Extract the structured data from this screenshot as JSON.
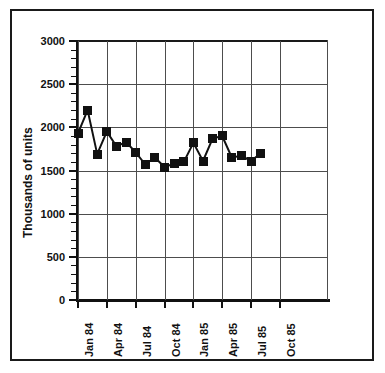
{
  "chart_data": {
    "type": "line",
    "title": "",
    "subtitle": "",
    "xlabel": "",
    "ylabel": "Thousands of units",
    "ylim": [
      0,
      3000
    ],
    "ytick_values": [
      0,
      500,
      1000,
      1500,
      2000,
      2500,
      3000
    ],
    "ytick_labels": [
      "0",
      "500",
      "1000",
      "1500",
      "2000",
      "2500",
      "3000"
    ],
    "y_minor_tick_step": 100,
    "xtick_labels": [
      "Jan 84",
      "Apr 84",
      "Jul 84",
      "Oct 84",
      "Jan 85",
      "Apr 85",
      "Jul 85",
      "Oct 85"
    ],
    "xtick_index": [
      0,
      3,
      6,
      9,
      12,
      15,
      18,
      21
    ],
    "grid": true,
    "grid_axis": "both",
    "legend": "none",
    "marker": "square",
    "marker_color": "#111111",
    "line_color": "#111111",
    "x": [
      "Jan 84",
      "Feb 84",
      "Mar 84",
      "Apr 84",
      "May 84",
      "Jun 84",
      "Jul 84",
      "Aug 84",
      "Sep 84",
      "Oct 84",
      "Nov 84",
      "Dec 84",
      "Jan 85",
      "Feb 85",
      "Mar 85",
      "Apr 85",
      "May 85",
      "Jun 85",
      "Jul 85",
      "Aug 85",
      "Sep 85",
      "Oct 85",
      "Nov 85",
      "Dec 85"
    ],
    "series": [
      {
        "name": "Housing starts",
        "values": [
          1930,
          2200,
          1690,
          1950,
          1780,
          1830,
          1710,
          1570,
          1650,
          1540,
          1580,
          1600,
          1820,
          1610,
          1870,
          1900,
          1650,
          1670,
          1610,
          1700,
          null,
          null,
          null,
          null
        ]
      }
    ],
    "n_plotted_points": 20
  },
  "axes": {
    "y_label_text": "Thousands of units"
  }
}
